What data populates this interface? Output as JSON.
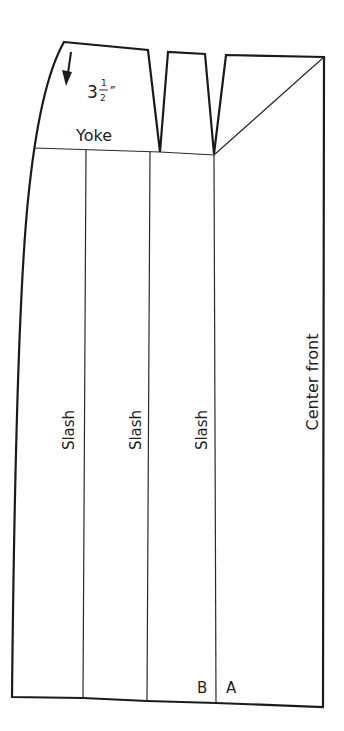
{
  "diagram": {
    "type": "sewing-pattern",
    "labels": {
      "measurement_whole": "3",
      "measurement_num": "1",
      "measurement_den": "2",
      "measurement_unit": "″",
      "yoke": "Yoke",
      "slash_1": "Slash",
      "slash_2": "Slash",
      "slash_3": "Slash",
      "center_front": "Center front",
      "point_b": "B",
      "point_a": "A"
    },
    "colors": {
      "line": "#1a1a1a",
      "background": "#ffffff"
    }
  }
}
